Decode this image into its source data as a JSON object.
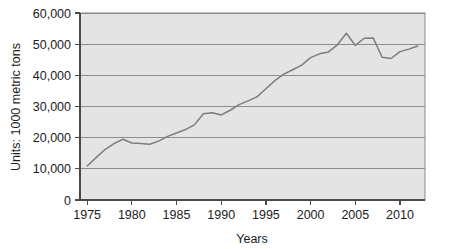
{
  "chart_data": {
    "type": "line",
    "title": "",
    "xlabel": "Years",
    "ylabel": "Units: 1000 metric tons",
    "xlim": [
      1974.2,
      2012.8
    ],
    "ylim": [
      0,
      60000
    ],
    "grid": true,
    "legend": "none",
    "line_color": "#7d7d7d",
    "plot_background": "#e4e4e4",
    "x_ticks": [
      1975,
      1980,
      1985,
      1990,
      1995,
      2000,
      2005,
      2010
    ],
    "x_tick_labels": [
      "1975",
      "1980",
      "1985",
      "1990",
      "1995",
      "2000",
      "2005",
      "2010"
    ],
    "y_ticks": [
      0,
      10000,
      20000,
      30000,
      40000,
      50000,
      60000
    ],
    "y_tick_labels": [
      "0",
      "10,000",
      "20,000",
      "30,000",
      "40,000",
      "50,000",
      "60,000"
    ],
    "x": [
      1975,
      1976,
      1977,
      1978,
      1979,
      1980,
      1981,
      1982,
      1983,
      1984,
      1985,
      1986,
      1987,
      1988,
      1989,
      1990,
      1991,
      1992,
      1993,
      1994,
      1995,
      1996,
      1997,
      1998,
      1999,
      2000,
      2001,
      2002,
      2003,
      2004,
      2005,
      2006,
      2007,
      2008,
      2009,
      2010,
      2011,
      2012
    ],
    "values": [
      10900,
      13600,
      16200,
      18100,
      19500,
      18300,
      18100,
      17900,
      18900,
      20400,
      21500,
      22600,
      24100,
      27700,
      28000,
      27300,
      28800,
      30600,
      31800,
      33100,
      35700,
      38300,
      40400,
      41800,
      43300,
      45700,
      46900,
      47500,
      49800,
      53500,
      49600,
      51900,
      52000,
      45800,
      45400,
      47600,
      48400,
      49400
    ],
    "series_name": "Production"
  },
  "axes": {
    "y_title": "Units: 1000 metric tons",
    "x_title": "Years"
  }
}
